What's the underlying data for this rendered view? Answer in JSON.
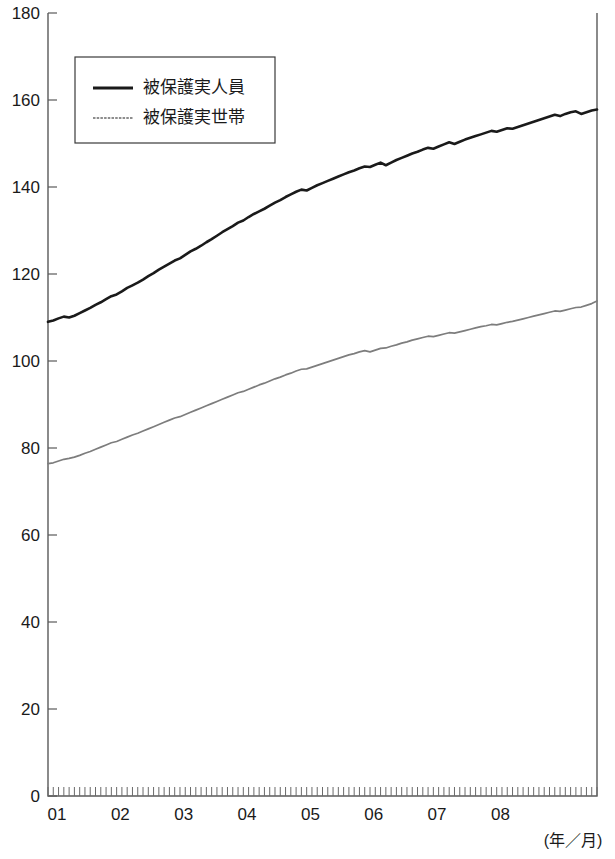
{
  "chart_data": {
    "type": "line",
    "title": "",
    "subtitle": "",
    "xlabel": "(年／月)",
    "ylabel": "",
    "ylim": [
      0,
      180
    ],
    "ytick_values": [
      0,
      20,
      40,
      60,
      80,
      100,
      120,
      140,
      160,
      180
    ],
    "ytick_labels": [
      "0",
      "20",
      "40",
      "60",
      "80",
      "100",
      "120",
      "140",
      "160",
      "180"
    ],
    "xtick_labels": [
      "01",
      "02",
      "03",
      "04",
      "05",
      "06",
      "07",
      "08"
    ],
    "x_unit": "month",
    "x_start": "2001/01",
    "x_end": "2008/08",
    "grid": false,
    "legend_position": "upper-left-inside",
    "minor_ticks": "monthly",
    "series": [
      {
        "name": "被保護実人員",
        "color": "#1a1a1a",
        "style": "thick-solid",
        "values": [
          109.0,
          109.3,
          109.8,
          110.2,
          110.0,
          110.4,
          111.0,
          111.6,
          112.2,
          112.9,
          113.5,
          114.2,
          114.9,
          115.3,
          116.0,
          116.8,
          117.4,
          118.0,
          118.7,
          119.5,
          120.2,
          121.0,
          121.7,
          122.4,
          123.1,
          123.6,
          124.4,
          125.2,
          125.8,
          126.5,
          127.3,
          128.0,
          128.8,
          129.6,
          130.3,
          131.0,
          131.8,
          132.3,
          133.1,
          133.8,
          134.4,
          135.0,
          135.7,
          136.4,
          137.0,
          137.7,
          138.3,
          138.9,
          139.4,
          139.2,
          139.8,
          140.4,
          140.9,
          141.4,
          141.9,
          142.4,
          142.9,
          143.4,
          143.8,
          144.3,
          144.7,
          144.6,
          145.1,
          145.6,
          145.0,
          145.6,
          146.2,
          146.7,
          147.2,
          147.7,
          148.1,
          148.6,
          149.0,
          148.8,
          149.3,
          149.8,
          150.3,
          149.9,
          150.4,
          150.9,
          151.3,
          151.7,
          152.1,
          152.5,
          152.9,
          152.7,
          153.1,
          153.5,
          153.4,
          153.8,
          154.2,
          154.6,
          155.0,
          155.4,
          155.8,
          156.2,
          156.6,
          156.3,
          156.8,
          157.2,
          157.4,
          156.8,
          157.2,
          157.6,
          157.8
        ]
      },
      {
        "name": "被保護実世帯",
        "color": "#7d7d7d",
        "style": "thin-solid",
        "values": [
          76.4,
          76.6,
          77.0,
          77.4,
          77.6,
          77.9,
          78.3,
          78.8,
          79.2,
          79.7,
          80.2,
          80.7,
          81.2,
          81.5,
          82.0,
          82.5,
          83.0,
          83.4,
          83.9,
          84.4,
          84.9,
          85.4,
          85.9,
          86.4,
          86.9,
          87.2,
          87.7,
          88.2,
          88.7,
          89.2,
          89.7,
          90.2,
          90.7,
          91.2,
          91.7,
          92.2,
          92.7,
          93.0,
          93.5,
          94.0,
          94.5,
          94.9,
          95.4,
          95.9,
          96.3,
          96.8,
          97.2,
          97.7,
          98.1,
          98.2,
          98.6,
          99.0,
          99.4,
          99.8,
          100.2,
          100.6,
          101.0,
          101.4,
          101.7,
          102.1,
          102.4,
          102.1,
          102.5,
          102.9,
          103.0,
          103.4,
          103.7,
          104.1,
          104.4,
          104.8,
          105.1,
          105.4,
          105.7,
          105.6,
          105.9,
          106.2,
          106.5,
          106.4,
          106.7,
          107.0,
          107.3,
          107.6,
          107.9,
          108.1,
          108.4,
          108.3,
          108.6,
          108.9,
          109.1,
          109.4,
          109.7,
          110.0,
          110.3,
          110.6,
          110.9,
          111.2,
          111.5,
          111.4,
          111.7,
          112.0,
          112.3,
          112.4,
          112.8,
          113.2,
          113.8
        ]
      }
    ]
  },
  "legend": {
    "items": [
      {
        "label": "被保護実人員",
        "swatch": "thick-black-line"
      },
      {
        "label": "被保護実世帯",
        "swatch": "thin-gray-line"
      }
    ]
  },
  "axis": {
    "x_caption": "(年／月)"
  }
}
